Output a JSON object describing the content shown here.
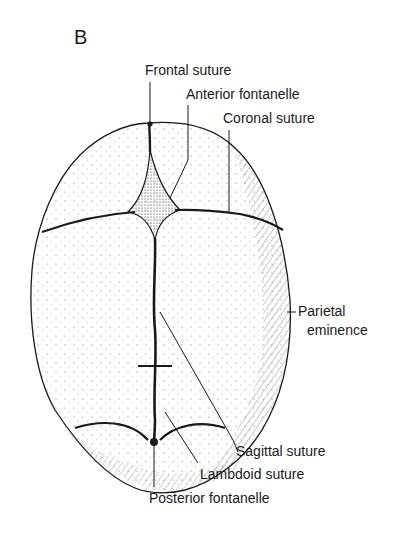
{
  "figure": {
    "panel_letter": "B",
    "labels": {
      "frontal_suture": "Frontal suture",
      "anterior_fontanelle": "Anterior fontanelle",
      "coronal_suture": "Coronal suture",
      "parietal_eminence_line1": "Parietal",
      "parietal_eminence_line2": "eminence",
      "sagittal_suture": "Sagittal suture",
      "lambdoid_suture": "Lambdoid suture",
      "posterior_fontanelle": "Posterior fontanelle"
    },
    "colors": {
      "ink": "#1a1a1a",
      "background": "#ffffff"
    }
  }
}
